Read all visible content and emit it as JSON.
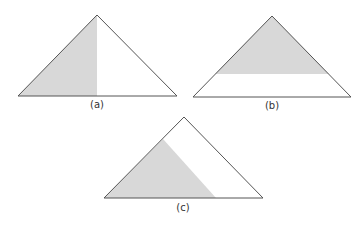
{
  "colors": {
    "shade": "#d8d8d8",
    "stroke": "#555555",
    "background": "#ffffff"
  },
  "figures": [
    {
      "id": "a",
      "label": "(a)",
      "triangle": {
        "apex": [
          97,
          15
        ],
        "left": [
          18,
          96
        ],
        "right": [
          177,
          96
        ]
      },
      "shaded_region": "left half, split by vertical line from apex to base midpoint",
      "shaded_polygon": [
        [
          97,
          15
        ],
        [
          18,
          96
        ],
        [
          97,
          96
        ]
      ]
    },
    {
      "id": "b",
      "label": "(b)",
      "triangle": {
        "apex": [
          272,
          16
        ],
        "left": [
          193,
          97
        ],
        "right": [
          351,
          97
        ]
      },
      "shaded_region": "upper portion above a horizontal line",
      "shaded_polygon": [
        [
          272,
          16
        ],
        [
          215,
          74
        ],
        [
          329,
          74
        ]
      ]
    },
    {
      "id": "c",
      "label": "(c)",
      "triangle": {
        "apex": [
          184,
          117
        ],
        "left": [
          104,
          198
        ],
        "right": [
          263,
          198
        ]
      },
      "shaded_region": "lower-left portion cut by a line parallel to the right side",
      "shaded_polygon": [
        [
          163,
          139
        ],
        [
          104,
          198
        ],
        [
          216,
          198
        ]
      ]
    }
  ]
}
